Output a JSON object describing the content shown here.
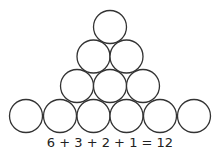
{
  "diagram": {
    "type": "triangular-circle-arrangement",
    "rows": [
      {
        "row": 1,
        "count": 1
      },
      {
        "row": 2,
        "count": 2
      },
      {
        "row": 3,
        "count": 3
      },
      {
        "row": 4,
        "count": 6
      }
    ],
    "stroke_color": "#333333",
    "fill_color": "#ffffff"
  },
  "caption": {
    "equation": "6 + 3 + 2 + 1 = 12"
  }
}
